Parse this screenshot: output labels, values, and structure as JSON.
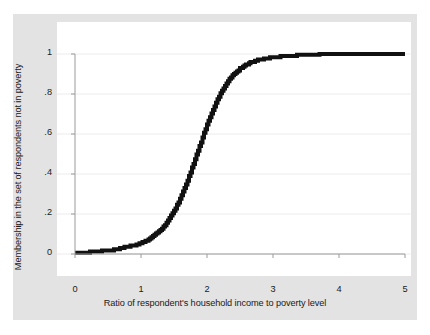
{
  "chart_data": {
    "type": "line",
    "title": "",
    "subtitle": "",
    "xlabel": "Ratio of respondent's household income to poverty level",
    "ylabel": "Membership in the set of respondents not in poverty",
    "xlim": [
      0,
      5
    ],
    "ylim": [
      0,
      1
    ],
    "xticks": [
      "0",
      "1",
      "2",
      "3",
      "4",
      "5"
    ],
    "xtick_values": [
      0,
      1,
      2,
      3,
      4,
      5
    ],
    "yticks": [
      "0",
      ".2",
      ".4",
      ".6",
      ".8",
      "1"
    ],
    "ytick_values": [
      0,
      0.2,
      0.4,
      0.6,
      0.8,
      1
    ],
    "grid": "horizontal",
    "legend": "none",
    "line_color": "#111111",
    "line_width": 4,
    "panel_color": "#ffffff",
    "canvas_color": "#e3e3e3",
    "grid_color": "#ececec",
    "axis_color": "#9a9a9a",
    "series": [
      {
        "name": "Fuzzy set membership (calibrated)",
        "x": [
          0.0,
          0.1,
          0.2,
          0.25,
          0.3,
          0.4,
          0.5,
          0.55,
          0.6,
          0.65,
          0.7,
          0.8,
          0.9,
          1.0,
          1.05,
          1.1,
          1.15,
          1.2,
          1.25,
          1.3,
          1.35,
          1.4,
          1.45,
          1.5,
          1.55,
          1.6,
          1.65,
          1.7,
          1.75,
          1.8,
          1.85,
          1.9,
          1.95,
          2.0,
          2.05,
          2.1,
          2.15,
          2.2,
          2.25,
          2.3,
          2.35,
          2.4,
          2.45,
          2.5,
          2.55,
          2.6,
          2.65,
          2.7,
          2.75,
          2.8,
          2.9,
          3.0,
          3.1,
          3.2,
          3.3,
          3.4,
          3.5,
          3.6,
          3.7,
          3.75,
          3.9,
          4.0,
          4.25,
          4.5,
          4.75,
          5.0
        ],
        "y": [
          0.005,
          0.006,
          0.008,
          0.012,
          0.013,
          0.015,
          0.017,
          0.02,
          0.022,
          0.026,
          0.03,
          0.036,
          0.044,
          0.055,
          0.062,
          0.07,
          0.08,
          0.092,
          0.106,
          0.122,
          0.141,
          0.163,
          0.188,
          0.216,
          0.248,
          0.283,
          0.322,
          0.364,
          0.409,
          0.456,
          0.504,
          0.552,
          0.6,
          0.646,
          0.69,
          0.73,
          0.767,
          0.8,
          0.83,
          0.856,
          0.878,
          0.897,
          0.913,
          0.927,
          0.938,
          0.948,
          0.956,
          0.962,
          0.968,
          0.972,
          0.979,
          0.984,
          0.987,
          0.99,
          0.992,
          0.994,
          0.996,
          0.998,
          0.999,
          1.0,
          1.0,
          1.0,
          1.0,
          1.0,
          1.0,
          1.0
        ]
      }
    ]
  }
}
